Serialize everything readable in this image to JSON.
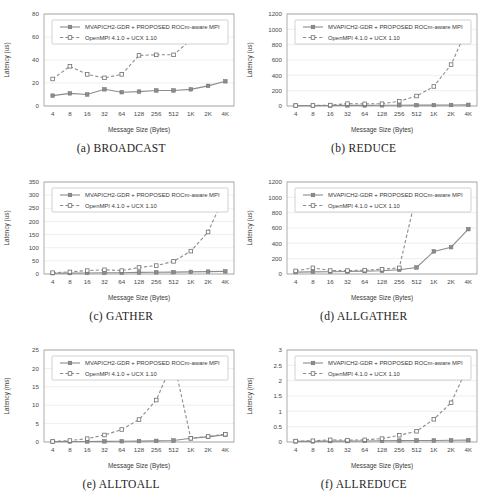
{
  "figure": {
    "series_names": [
      "MVAPICH2-GDR + PROPOSED ROCm-aware MPI",
      "OpenMPI 4.1.0 + UCX 1.10"
    ],
    "xlabel": "Message Size (Bytes)",
    "categories": [
      "4",
      "8",
      "16",
      "32",
      "64",
      "128",
      "256",
      "512",
      "1K",
      "2K",
      "4K"
    ],
    "colors": {
      "line": "#8c8c8c",
      "grid": "#e8e8e8",
      "axis": "#9a9a9a",
      "text": "#3a3a3a"
    }
  },
  "chart_data": [
    {
      "type": "line",
      "panel": "a",
      "title": "(a) BROADCAST",
      "xlabel": "Message Size (Bytes)",
      "ylabel": "Latency (us)",
      "categories": [
        "4",
        "8",
        "16",
        "32",
        "64",
        "128",
        "256",
        "512",
        "1K",
        "2K",
        "4K"
      ],
      "ylim": [
        0,
        80
      ],
      "yticks": [
        0,
        20,
        40,
        60,
        80
      ],
      "grid": true,
      "legend": "top-inside",
      "series": [
        {
          "name": "MVAPICH2-GDR + PROPOSED ROCm-aware MPI",
          "values": [
            9,
            11,
            10,
            14.5,
            12,
            12.5,
            13.5,
            13.5,
            14.5,
            17.5,
            21.5
          ]
        },
        {
          "name": "OpenMPI 4.1.0 + UCX 1.10",
          "values": [
            23.5,
            34.5,
            27.5,
            24.5,
            27.5,
            44,
            44.5,
            44.5,
            57.5,
            59,
            66
          ]
        }
      ]
    },
    {
      "type": "line",
      "panel": "b",
      "title": "(b) REDUCE",
      "xlabel": "Message Size (Bytes)",
      "ylabel": "Latency (us)",
      "categories": [
        "4",
        "8",
        "16",
        "32",
        "64",
        "128",
        "256",
        "512",
        "1K",
        "2K",
        "4K"
      ],
      "ylim": [
        0,
        1200
      ],
      "yticks": [
        0,
        200,
        400,
        600,
        800,
        1000,
        1200
      ],
      "grid": true,
      "legend": "top-inside",
      "series": [
        {
          "name": "MVAPICH2-GDR + PROPOSED ROCm-aware MPI",
          "values": [
            5,
            5,
            6,
            8,
            8,
            9,
            10,
            11,
            12,
            13,
            15
          ]
        },
        {
          "name": "OpenMPI 4.1.0 + UCX 1.10",
          "values": [
            6,
            7,
            12,
            31,
            28,
            30,
            62,
            130,
            255,
            540,
            1045
          ]
        }
      ]
    },
    {
      "type": "line",
      "panel": "c",
      "title": "(c) GATHER",
      "xlabel": "Message Size (Bytes)",
      "ylabel": "Latency (us)",
      "categories": [
        "4",
        "8",
        "16",
        "32",
        "64",
        "128",
        "256",
        "512",
        "1K",
        "2K",
        "4K"
      ],
      "ylim": [
        0,
        350
      ],
      "yticks": [
        0,
        50,
        100,
        150,
        200,
        250,
        300,
        350
      ],
      "grid": true,
      "legend": "top-inside",
      "series": [
        {
          "name": "MVAPICH2-GDR + PROPOSED ROCm-aware MPI",
          "values": [
            3,
            3.5,
            4,
            5,
            5,
            6,
            6.5,
            7,
            8,
            9,
            10
          ]
        },
        {
          "name": "OpenMPI 4.1.0 + UCX 1.10",
          "values": [
            5,
            8,
            13,
            16,
            13,
            25,
            32,
            48,
            87,
            160,
            305
          ]
        }
      ]
    },
    {
      "type": "line",
      "panel": "d",
      "title": "(d) ALLGATHER",
      "xlabel": "Message Size (Bytes)",
      "ylabel": "Latency (us)",
      "categories": [
        "4",
        "8",
        "16",
        "32",
        "64",
        "128",
        "256",
        "512",
        "1K",
        "2K",
        "4K"
      ],
      "ylim": [
        0,
        1200
      ],
      "yticks": [
        0,
        200,
        400,
        600,
        800,
        1000,
        1200
      ],
      "grid": true,
      "legend": "top-inside",
      "series": [
        {
          "name": "MVAPICH2-GDR + PROPOSED ROCm-aware MPI",
          "values": [
            25,
            28,
            30,
            33,
            38,
            42,
            55,
            85,
            295,
            350,
            585
          ]
        },
        {
          "name": "OpenMPI 4.1.0 + UCX 1.10",
          "values": [
            40,
            80,
            45,
            45,
            50,
            62,
            80,
            1050,
            null,
            null,
            null
          ]
        }
      ]
    },
    {
      "type": "line",
      "panel": "e",
      "title": "(e) ALLTOALL",
      "xlabel": "Message Size (Bytes)",
      "ylabel": "Latency (ms)",
      "categories": [
        "4",
        "8",
        "16",
        "32",
        "64",
        "128",
        "256",
        "512",
        "1K",
        "2K",
        "4K"
      ],
      "ylim": [
        0,
        25
      ],
      "yticks": [
        0,
        5,
        10,
        15,
        20,
        25
      ],
      "grid": true,
      "legend": "top-inside",
      "series": [
        {
          "name": "MVAPICH2-GDR + PROPOSED ROCm-aware MPI",
          "values": [
            0.1,
            0.12,
            0.15,
            0.18,
            0.2,
            0.25,
            0.3,
            0.4,
            1.0,
            1.4,
            2.0
          ]
        },
        {
          "name": "OpenMPI 4.1.0 + UCX 1.10",
          "values": [
            0.15,
            0.4,
            0.9,
            1.9,
            3.4,
            6.1,
            11.4,
            22.2,
            1.0,
            1.5,
            2.1
          ]
        }
      ]
    },
    {
      "type": "line",
      "panel": "f",
      "title": "(f) ALLREDUCE",
      "xlabel": "Message Size (Bytes)",
      "ylabel": "Latency (ms)",
      "categories": [
        "4",
        "8",
        "16",
        "32",
        "64",
        "128",
        "256",
        "512",
        "1K",
        "2K",
        "4K"
      ],
      "ylim": [
        0,
        3
      ],
      "yticks": [
        0,
        0.5,
        1,
        1.5,
        2,
        2.5,
        3
      ],
      "ytick_labels": [
        "0",
        "0.5",
        "1",
        "1.5",
        "2",
        "2.5",
        "3"
      ],
      "grid": true,
      "legend": "top-inside",
      "series": [
        {
          "name": "MVAPICH2-GDR + PROPOSED ROCm-aware MPI",
          "values": [
            0.02,
            0.02,
            0.03,
            0.03,
            0.035,
            0.04,
            0.045,
            0.05,
            0.05,
            0.055,
            0.06
          ]
        },
        {
          "name": "OpenMPI 4.1.0 + UCX 1.10",
          "values": [
            0.03,
            0.04,
            0.07,
            0.06,
            0.07,
            0.11,
            0.22,
            0.35,
            0.74,
            1.28,
            2.5
          ]
        }
      ]
    }
  ]
}
